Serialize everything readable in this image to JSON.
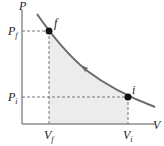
{
  "diagram": {
    "type": "PV diagram",
    "axis_labels": {
      "y": "P",
      "x": "V"
    },
    "points": [
      {
        "name": "f",
        "pressure_label": "P",
        "pressure_sub": "f",
        "volume_label": "V",
        "volume_sub": "f"
      },
      {
        "name": "i",
        "pressure_label": "P",
        "pressure_sub": "i",
        "volume_label": "V",
        "volume_sub": "i"
      }
    ],
    "process_direction": "from i to f",
    "colors": {
      "curve": "#6b6b6b",
      "fill": "#ececec",
      "point": "#111111",
      "axis": "#555555"
    }
  }
}
